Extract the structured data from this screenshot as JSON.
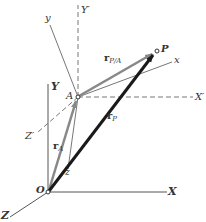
{
  "diagram": {
    "colors": {
      "background": "#ffffff",
      "axis": "#555555",
      "dashed_axis": "#777777",
      "r_P": "#1a1a1a",
      "r_A": "#888888",
      "r_PA": "#888888"
    },
    "points": {
      "O": {
        "label": "O",
        "x": 48,
        "y": 192
      },
      "A": {
        "label": "A",
        "x": 78,
        "y": 97
      },
      "P": {
        "label": "P",
        "x": 157,
        "y": 51
      }
    },
    "fixed_axes": {
      "X": {
        "label": "X"
      },
      "Y": {
        "label": "Y"
      },
      "Z": {
        "label": "Z"
      }
    },
    "translating_axes_dashed": {
      "X_prime": {
        "label": "X′"
      },
      "Y_prime": {
        "label": "Y′"
      },
      "Z_prime": {
        "label": "Z′"
      }
    },
    "rotating_axes": {
      "x": {
        "label": "x"
      },
      "y": {
        "label": "y"
      },
      "z": {
        "label": "z"
      }
    },
    "vectors": {
      "r_P": {
        "main": "r",
        "sub": "P"
      },
      "r_A": {
        "main": "r",
        "sub": "A"
      },
      "r_PA": {
        "main": "r",
        "sub": "P/A"
      }
    }
  }
}
